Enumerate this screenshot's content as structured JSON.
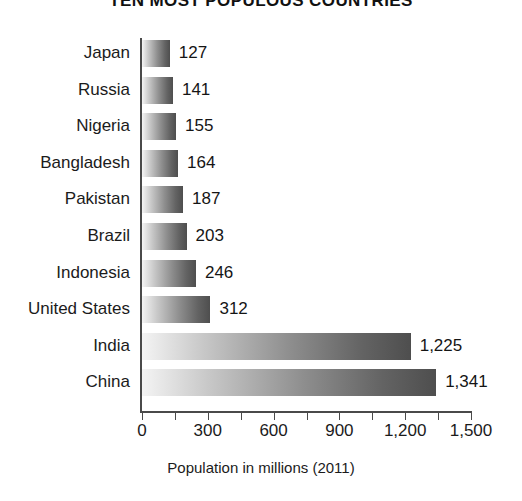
{
  "chart_data": {
    "type": "bar",
    "orientation": "horizontal",
    "title": "TEN MOST POPULOUS COUNTRIES",
    "xlabel": "Population in millions (2011)",
    "ylabel": "",
    "xlim": [
      0,
      1500
    ],
    "grid": false,
    "legend": null,
    "categories": [
      "Japan",
      "Russia",
      "Nigeria",
      "Bangladesh",
      "Pakistan",
      "Brazil",
      "Indonesia",
      "United States",
      "India",
      "China"
    ],
    "values": [
      127,
      141,
      155,
      164,
      187,
      203,
      246,
      312,
      1225,
      1341
    ],
    "value_labels": [
      "127",
      "141",
      "155",
      "164",
      "187",
      "203",
      "246",
      "312",
      "1,225",
      "1,341"
    ],
    "xticks": [
      0,
      150,
      300,
      450,
      600,
      750,
      900,
      1050,
      1200,
      1350,
      1500
    ],
    "xtick_labels": [
      {
        "value": 0,
        "label": "0"
      },
      {
        "value": 150,
        "label": ""
      },
      {
        "value": 300,
        "label": "300"
      },
      {
        "value": 450,
        "label": ""
      },
      {
        "value": 600,
        "label": "600"
      },
      {
        "value": 750,
        "label": ""
      },
      {
        "value": 900,
        "label": "900"
      },
      {
        "value": 1050,
        "label": ""
      },
      {
        "value": 1200,
        "label": "1,200"
      },
      {
        "value": 1350,
        "label": ""
      },
      {
        "value": 1500,
        "label": "1,500"
      }
    ],
    "bar_gradient": {
      "from": "#f4f4f4",
      "to": "#4e4e4e",
      "direction": "left-to-right"
    },
    "axis_color": "#4a4a4a",
    "text_color": "#1b1b1b",
    "background": "#ffffff"
  }
}
